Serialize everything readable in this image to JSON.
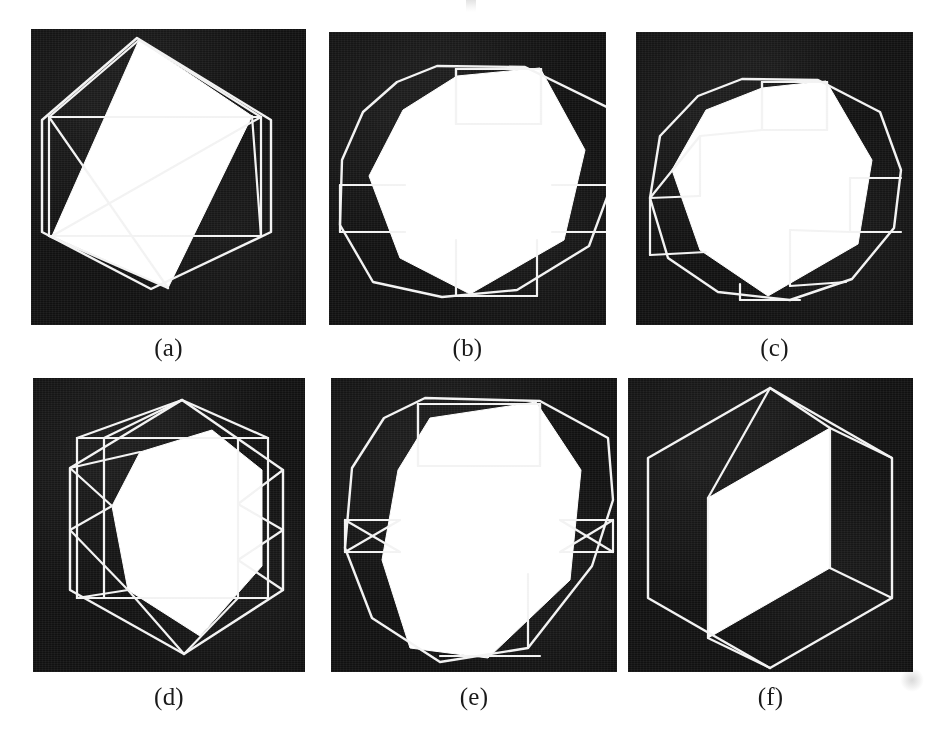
{
  "figure": {
    "background_color": "#ffffff",
    "panel_background_color": "#111111",
    "stroke_color": "#f2f2f2",
    "fill_color": "#ffffff",
    "caption_color": "#1a1a1a",
    "layout": {
      "rows": 2,
      "columns": 3
    }
  },
  "panels": [
    {
      "id": "a",
      "caption": "(a)",
      "kind": "wireframe-with-filled-face",
      "description": "hexagonal silhouette with inner rectangle and a large white rotated quadrilateral face",
      "x": 31,
      "y": 29,
      "width": 275,
      "height": 296,
      "caption_x": 31,
      "caption_y": 333,
      "caption_width": 275,
      "outline": [
        [
          137,
          38
        ],
        [
          271,
          120
        ],
        [
          271,
          232
        ],
        [
          151,
          289
        ],
        [
          42,
          232
        ],
        [
          42,
          120
        ]
      ],
      "inner_rect": [
        [
          49,
          117
        ],
        [
          261,
          117
        ],
        [
          261,
          236
        ],
        [
          49,
          236
        ]
      ],
      "face": [
        [
          139,
          40
        ],
        [
          252,
          116
        ],
        [
          168,
          288
        ],
        [
          52,
          236
        ]
      ],
      "edges": [
        [
          [
            49,
            117
          ],
          [
            139,
            40
          ]
        ],
        [
          [
            139,
            40
          ],
          [
            261,
            117
          ]
        ],
        [
          [
            49,
            117
          ],
          [
            168,
            288
          ]
        ],
        [
          [
            261,
            117
          ],
          [
            52,
            236
          ]
        ],
        [
          [
            49,
            236
          ],
          [
            168,
            288
          ]
        ],
        [
          [
            261,
            236
          ],
          [
            252,
            116
          ]
        ]
      ]
    },
    {
      "id": "b",
      "caption": "(b)",
      "kind": "wireframe-with-filled-face",
      "description": "decagonal silhouette with chamfered facets and a large white lens-shaped face",
      "x": 329,
      "y": 32,
      "width": 277,
      "height": 293,
      "caption_x": 329,
      "caption_y": 333,
      "caption_width": 277,
      "outline": [
        [
          437,
          66
        ],
        [
          525,
          67
        ],
        [
          613,
          110
        ],
        [
          617,
          170
        ],
        [
          589,
          246
        ],
        [
          517,
          290
        ],
        [
          442,
          297
        ],
        [
          373,
          282
        ],
        [
          340,
          225
        ],
        [
          342,
          160
        ],
        [
          363,
          112
        ],
        [
          397,
          82
        ]
      ],
      "inner_rect": [
        [
          456,
          69
        ],
        [
          541,
          69
        ],
        [
          541,
          124
        ],
        [
          456,
          124
        ]
      ],
      "face": [
        [
          540,
          68
        ],
        [
          585,
          150
        ],
        [
          564,
          240
        ],
        [
          470,
          294
        ],
        [
          400,
          258
        ],
        [
          369,
          176
        ],
        [
          403,
          110
        ],
        [
          457,
          76
        ]
      ],
      "edges": [
        [
          [
            456,
            69
          ],
          [
            456,
            124
          ]
        ],
        [
          [
            456,
            124
          ],
          [
            541,
            124
          ]
        ],
        [
          [
            541,
            69
          ],
          [
            541,
            124
          ]
        ],
        [
          [
            340,
            185
          ],
          [
            405,
            185
          ]
        ],
        [
          [
            340,
            232
          ],
          [
            405,
            232
          ]
        ],
        [
          [
            340,
            185
          ],
          [
            340,
            232
          ]
        ],
        [
          [
            552,
            185
          ],
          [
            617,
            185
          ]
        ],
        [
          [
            552,
            232
          ],
          [
            617,
            232
          ]
        ],
        [
          [
            617,
            185
          ],
          [
            617,
            232
          ]
        ],
        [
          [
            456,
            240
          ],
          [
            456,
            296
          ]
        ],
        [
          [
            456,
            296
          ],
          [
            537,
            296
          ]
        ],
        [
          [
            537,
            240
          ],
          [
            537,
            296
          ]
        ]
      ]
    },
    {
      "id": "c",
      "caption": "(c)",
      "kind": "wireframe-with-filled-face",
      "description": "many-faceted polygon subdivided into quadrilateral cells around a large white face",
      "x": 636,
      "y": 32,
      "width": 277,
      "height": 293,
      "caption_x": 636,
      "caption_y": 333,
      "caption_width": 277,
      "outline": [
        [
          742,
          79
        ],
        [
          818,
          80
        ],
        [
          880,
          112
        ],
        [
          901,
          170
        ],
        [
          894,
          228
        ],
        [
          852,
          279
        ],
        [
          790,
          300
        ],
        [
          718,
          292
        ],
        [
          668,
          258
        ],
        [
          650,
          198
        ],
        [
          660,
          136
        ],
        [
          698,
          96
        ]
      ],
      "inner_rect": [
        [
          762,
          82
        ],
        [
          827,
          82
        ],
        [
          827,
          130
        ],
        [
          762,
          130
        ]
      ],
      "face": [
        [
          826,
          81
        ],
        [
          872,
          160
        ],
        [
          858,
          244
        ],
        [
          768,
          296
        ],
        [
          700,
          250
        ],
        [
          672,
          170
        ],
        [
          706,
          110
        ],
        [
          762,
          88
        ]
      ],
      "edges": [
        [
          [
            762,
            82
          ],
          [
            762,
            130
          ]
        ],
        [
          [
            762,
            130
          ],
          [
            827,
            130
          ]
        ],
        [
          [
            827,
            82
          ],
          [
            827,
            130
          ]
        ],
        [
          [
            700,
            136
          ],
          [
            762,
            130
          ]
        ],
        [
          [
            650,
            198
          ],
          [
            700,
            136
          ]
        ],
        [
          [
            650,
            198
          ],
          [
            700,
            196
          ]
        ],
        [
          [
            700,
            196
          ],
          [
            700,
            136
          ]
        ],
        [
          [
            650,
            198
          ],
          [
            650,
            255
          ]
        ],
        [
          [
            650,
            255
          ],
          [
            706,
            252
          ]
        ],
        [
          [
            850,
            178
          ],
          [
            901,
            178
          ]
        ],
        [
          [
            850,
            178
          ],
          [
            850,
            232
          ]
        ],
        [
          [
            850,
            232
          ],
          [
            901,
            232
          ]
        ],
        [
          [
            790,
            230
          ],
          [
            850,
            232
          ]
        ],
        [
          [
            790,
            230
          ],
          [
            790,
            286
          ]
        ],
        [
          [
            790,
            286
          ],
          [
            846,
            282
          ]
        ],
        [
          [
            740,
            284
          ],
          [
            740,
            300
          ]
        ],
        [
          [
            740,
            300
          ],
          [
            800,
            300
          ]
        ]
      ]
    },
    {
      "id": "d",
      "caption": "(d)",
      "kind": "wireframe-with-filled-face",
      "description": "hexagonal silhouette with inner rectangle, triangulated fans and a white rounded face",
      "x": 33,
      "y": 378,
      "width": 272,
      "height": 294,
      "caption_x": 33,
      "caption_y": 682,
      "caption_width": 272,
      "outline": [
        [
          182,
          400
        ],
        [
          283,
          470
        ],
        [
          283,
          590
        ],
        [
          184,
          654
        ],
        [
          70,
          590
        ],
        [
          70,
          468
        ]
      ],
      "inner_rect": [
        [
          77,
          438
        ],
        [
          268,
          438
        ],
        [
          268,
          598
        ],
        [
          77,
          598
        ]
      ],
      "face": [
        [
          212,
          430
        ],
        [
          262,
          470
        ],
        [
          262,
          566
        ],
        [
          200,
          636
        ],
        [
          128,
          590
        ],
        [
          112,
          506
        ],
        [
          140,
          452
        ]
      ],
      "edges": [
        [
          [
            77,
            438
          ],
          [
            182,
            400
          ]
        ],
        [
          [
            182,
            400
          ],
          [
            268,
            438
          ]
        ],
        [
          [
            70,
            468
          ],
          [
            140,
            452
          ]
        ],
        [
          [
            70,
            468
          ],
          [
            112,
            506
          ]
        ],
        [
          [
            70,
            530
          ],
          [
            112,
            506
          ]
        ],
        [
          [
            70,
            530
          ],
          [
            128,
            590
          ]
        ],
        [
          [
            77,
            598
          ],
          [
            128,
            590
          ]
        ],
        [
          [
            104,
            438
          ],
          [
            104,
            598
          ]
        ],
        [
          [
            104,
            438
          ],
          [
            182,
            400
          ]
        ],
        [
          [
            238,
            438
          ],
          [
            238,
            598
          ]
        ],
        [
          [
            238,
            438
          ],
          [
            268,
            438
          ]
        ],
        [
          [
            283,
            470
          ],
          [
            238,
            504
          ]
        ],
        [
          [
            283,
            530
          ],
          [
            238,
            504
          ]
        ],
        [
          [
            283,
            530
          ],
          [
            238,
            560
          ]
        ],
        [
          [
            283,
            590
          ],
          [
            238,
            560
          ]
        ],
        [
          [
            238,
            598
          ],
          [
            184,
            654
          ]
        ],
        [
          [
            184,
            654
          ],
          [
            128,
            590
          ]
        ]
      ]
    },
    {
      "id": "e",
      "caption": "(e)",
      "kind": "wireframe-with-filled-face",
      "description": "octagonal silhouette with bowtie facets on left and right and a white lens face",
      "x": 331,
      "y": 378,
      "width": 286,
      "height": 294,
      "caption_x": 331,
      "caption_y": 682,
      "caption_width": 286,
      "outline": [
        [
          425,
          398
        ],
        [
          540,
          401
        ],
        [
          608,
          438
        ],
        [
          613,
          500
        ],
        [
          592,
          566
        ],
        [
          528,
          648
        ],
        [
          440,
          662
        ],
        [
          372,
          618
        ],
        [
          345,
          548
        ],
        [
          352,
          468
        ],
        [
          384,
          418
        ]
      ],
      "inner_rect": [
        [
          418,
          404
        ],
        [
          540,
          404
        ],
        [
          540,
          466
        ],
        [
          418,
          466
        ]
      ],
      "face": [
        [
          536,
          402
        ],
        [
          581,
          470
        ],
        [
          570,
          580
        ],
        [
          488,
          658
        ],
        [
          410,
          648
        ],
        [
          382,
          560
        ],
        [
          398,
          470
        ],
        [
          430,
          418
        ]
      ],
      "edges": [
        [
          [
            418,
            404
          ],
          [
            418,
            466
          ]
        ],
        [
          [
            418,
            466
          ],
          [
            540,
            466
          ]
        ],
        [
          [
            540,
            404
          ],
          [
            540,
            466
          ]
        ],
        [
          [
            345,
            520
          ],
          [
            400,
            520
          ]
        ],
        [
          [
            345,
            552
          ],
          [
            400,
            552
          ]
        ],
        [
          [
            345,
            520
          ],
          [
            345,
            552
          ]
        ],
        [
          [
            345,
            520
          ],
          [
            400,
            552
          ]
        ],
        [
          [
            345,
            552
          ],
          [
            400,
            520
          ]
        ],
        [
          [
            560,
            520
          ],
          [
            613,
            520
          ]
        ],
        [
          [
            560,
            552
          ],
          [
            613,
            552
          ]
        ],
        [
          [
            613,
            520
          ],
          [
            613,
            552
          ]
        ],
        [
          [
            560,
            520
          ],
          [
            613,
            552
          ]
        ],
        [
          [
            560,
            552
          ],
          [
            613,
            520
          ]
        ],
        [
          [
            528,
            574
          ],
          [
            528,
            648
          ]
        ],
        [
          [
            440,
            656
          ],
          [
            540,
            656
          ]
        ]
      ]
    },
    {
      "id": "f",
      "caption": "(f)",
      "kind": "isometric-cube",
      "description": "isometric cube hexagon outline with three visible edges and one white filled quadrilateral face",
      "x": 628,
      "y": 378,
      "width": 285,
      "height": 294,
      "caption_x": 628,
      "caption_y": 682,
      "caption_width": 285,
      "outline": [
        [
          770,
          388
        ],
        [
          892,
          458
        ],
        [
          892,
          598
        ],
        [
          770,
          668
        ],
        [
          648,
          598
        ],
        [
          648,
          458
        ]
      ],
      "inner_rect": [],
      "face": [
        [
          708,
          498
        ],
        [
          830,
          428
        ],
        [
          830,
          568
        ],
        [
          708,
          638
        ]
      ],
      "edges": [
        [
          [
            708,
            498
          ],
          [
            770,
            388
          ]
        ],
        [
          [
            708,
            498
          ],
          [
            708,
            638
          ]
        ],
        [
          [
            708,
            638
          ],
          [
            770,
            668
          ]
        ],
        [
          [
            830,
            428
          ],
          [
            770,
            388
          ]
        ],
        [
          [
            830,
            428
          ],
          [
            892,
            458
          ]
        ],
        [
          [
            830,
            568
          ],
          [
            892,
            598
          ]
        ],
        [
          [
            830,
            428
          ],
          [
            830,
            568
          ]
        ]
      ]
    }
  ]
}
